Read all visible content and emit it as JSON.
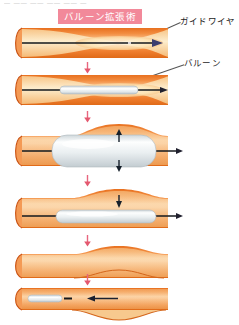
{
  "header": {
    "cut_text": "— —— —— ——  —— —"
  },
  "title": {
    "text": "バルーン拡張術",
    "badge_color": "#f2899a",
    "text_color": "#ffffff"
  },
  "labels": {
    "guidewire": "ガイドワイヤ",
    "balloon": "バルーン"
  },
  "colors": {
    "vessel_outer": "#ef7e36",
    "vessel_mid": "#f59a5c",
    "vessel_highlight": "#fbc79a",
    "vessel_rim": "#d45a19",
    "lumen_light": "#fde8c2",
    "lumen_core": "#fdf3dd",
    "balloon_body": "#e8ecee",
    "balloon_light": "#fdfefe",
    "balloon_edge": "#b9c2c6",
    "wire": "#1a1a1a",
    "connector_arrow": "#e8667e",
    "motion_arrow": "#16202b"
  },
  "panels": [
    {
      "id": "panel-1",
      "name": "stenosed-vessel-with-guidewire",
      "caption": "Narrowed vessel with guide wire advanced across the stenosis",
      "has_balloon": false,
      "wire_direction": "right"
    },
    {
      "id": "panel-2",
      "name": "deflated-balloon-positioned",
      "caption": "Deflated balloon catheter tracked over the wire into the narrowing",
      "has_balloon": true,
      "balloon_state": "deflated",
      "wire_direction": "right"
    },
    {
      "id": "panel-3",
      "name": "balloon-inflated",
      "caption": "Balloon inflated, expanding the vessel wall outward",
      "has_balloon": true,
      "balloon_state": "inflated",
      "motion_arrows": "outward"
    },
    {
      "id": "panel-4",
      "name": "balloon-deflating",
      "caption": "Balloon deflated, vessel remains widened",
      "has_balloon": true,
      "balloon_state": "deflating",
      "motion_arrows": "inward"
    },
    {
      "id": "panel-5",
      "name": "vessel-widened",
      "caption": "Vessel lumen enlarged after dilation",
      "has_balloon": false
    },
    {
      "id": "panel-6",
      "name": "balloon-withdrawn",
      "caption": "Deflated balloon catheter withdrawn from the dilated vessel",
      "has_balloon": true,
      "balloon_state": "deflated",
      "wire_direction": "left"
    }
  ],
  "connectors": [
    {
      "id": "conn-1",
      "name": "step-arrow-1-to-2"
    },
    {
      "id": "conn-2",
      "name": "step-arrow-2-to-3"
    },
    {
      "id": "conn-3",
      "name": "step-arrow-3-to-4"
    },
    {
      "id": "conn-4",
      "name": "step-arrow-4-to-5"
    },
    {
      "id": "conn-5",
      "name": "step-arrow-5-to-6"
    }
  ]
}
